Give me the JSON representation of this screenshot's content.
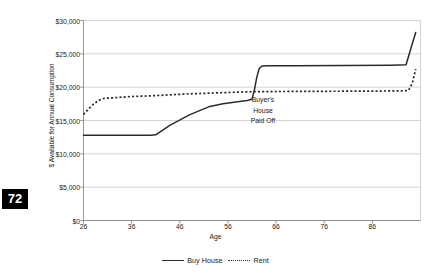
{
  "page": {
    "number": "72"
  },
  "chart_data": {
    "type": "line",
    "title": "",
    "xlabel": "Age",
    "ylabel": "$ Available for Annual Consumption",
    "xlim": [
      26,
      96
    ],
    "ylim": [
      0,
      30000
    ],
    "grid": true,
    "legend_position": "bottom",
    "xticks": [
      26,
      36,
      46,
      56,
      66,
      76,
      86
    ],
    "xtick_labels": [
      "26",
      "36",
      "46",
      "56",
      "66",
      "76",
      "86"
    ],
    "yticks": [
      0,
      5000,
      10000,
      15000,
      20000,
      25000,
      30000
    ],
    "ytick_labels": [
      "$0",
      "$5,000",
      "$10,000",
      "$15,000",
      "$20,000",
      "$25,000",
      "$30,000"
    ],
    "annotations": [
      {
        "text_lines": [
          "Buyer's",
          "House",
          "Paid Off"
        ],
        "x": 61,
        "y": 16000
      }
    ],
    "series": [
      {
        "name": "Buy House",
        "style": "solid",
        "color": "#2b2b2b",
        "x": [
          26,
          30,
          35,
          40,
          41,
          44,
          48,
          52,
          55,
          58,
          60,
          61,
          61.5,
          62,
          62.5,
          63,
          64,
          70,
          80,
          90,
          93,
          94,
          95
        ],
        "values": [
          12800,
          12800,
          12800,
          12800,
          12850,
          14300,
          15850,
          17050,
          17500,
          17800,
          18000,
          18200,
          19600,
          21500,
          22800,
          23150,
          23200,
          23220,
          23250,
          23300,
          23350,
          25800,
          28200
        ]
      },
      {
        "name": "Rent",
        "style": "dotted",
        "color": "#2b2b2b",
        "x": [
          26,
          27,
          28,
          29,
          30,
          32,
          36,
          40,
          44,
          48,
          52,
          56,
          58,
          60,
          62,
          64,
          70,
          76,
          82,
          88,
          92,
          93.5,
          94.3,
          95
        ],
        "values": [
          15900,
          16700,
          17400,
          17950,
          18300,
          18400,
          18600,
          18700,
          18850,
          19000,
          19100,
          19200,
          19250,
          19300,
          19320,
          19340,
          19360,
          19380,
          19400,
          19420,
          19450,
          19500,
          20600,
          22700
        ]
      }
    ]
  },
  "legend": {
    "entries": [
      {
        "label": "Buy House",
        "style": "solid"
      },
      {
        "label": "Rent",
        "style": "dotted"
      }
    ]
  }
}
